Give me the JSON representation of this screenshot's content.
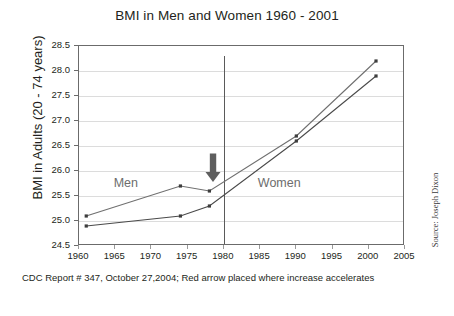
{
  "chart_data": {
    "type": "line",
    "title": "BMI in Men and Women 1960 - 2001",
    "xlabel": "",
    "ylabel": "BMI in Adults (20 - 74 years)",
    "xlim": [
      1960,
      2005
    ],
    "ylim": [
      24.5,
      28.5
    ],
    "ytick_labels": [
      "28.5",
      "28.0",
      "27.5",
      "27.0",
      "26.5",
      "26.0",
      "25.5",
      "25.0",
      "24.5"
    ],
    "ytick_values": [
      28.5,
      28.0,
      27.5,
      27.0,
      26.5,
      26.0,
      25.5,
      25.0,
      24.5
    ],
    "xtick_labels": [
      "1960",
      "1965",
      "1970",
      "1975",
      "1980",
      "1985",
      "1990",
      "1995",
      "2000",
      "2005"
    ],
    "xtick_values": [
      1960,
      1965,
      1970,
      1975,
      1980,
      1985,
      1990,
      1995,
      2000,
      2005
    ],
    "grid": true,
    "legend_position": "inline-annotations",
    "series": [
      {
        "name": "Men",
        "color": "#6f6f6f",
        "x": [
          1961,
          1974,
          1978,
          1990,
          2001
        ],
        "values": [
          25.1,
          25.7,
          25.6,
          26.7,
          28.2
        ]
      },
      {
        "name": "Women",
        "color": "#4a4a4a",
        "x": [
          1961,
          1974,
          1978,
          1990,
          2001
        ],
        "values": [
          24.9,
          25.1,
          25.3,
          26.6,
          27.9
        ]
      }
    ],
    "annotations": [
      {
        "type": "text",
        "label": "Men",
        "x": 1967,
        "y": 25.75
      },
      {
        "type": "text",
        "label": "Women",
        "x": 1988,
        "y": 25.75
      },
      {
        "type": "vline",
        "label": "reference-line-1980",
        "x": 1980,
        "color": "#5a5a5a"
      },
      {
        "type": "arrow",
        "label": "increase-accelerates-arrow",
        "x": 1978.5,
        "y_from": 26.35,
        "y_to": 25.78,
        "color": "#5e5e5e"
      }
    ],
    "caption": "CDC Report  # 347, October 27,2004;  Red arrow placed where increase accelerates",
    "source": "Source: Joseph Dixon"
  }
}
